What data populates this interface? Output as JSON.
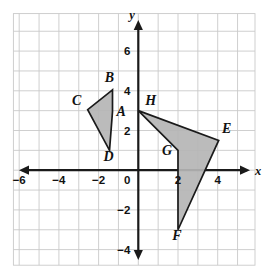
{
  "figure": {
    "kind": "coordinate-plane-diagram",
    "background_color": "#ffffff",
    "grid_color": "#c9c9c9",
    "axis_color": "#1a1a1a",
    "shape_fill_color": "#b5b5b5",
    "shape_stroke_color": "#1a1a1a"
  },
  "axes": {
    "x_label": "x",
    "y_label": "y",
    "x_ticks": [
      {
        "value": -6,
        "label": "−6"
      },
      {
        "value": -4,
        "label": "−4"
      },
      {
        "value": -2,
        "label": "−2"
      },
      {
        "value": 2,
        "label": "2"
      },
      {
        "value": 4,
        "label": "4"
      }
    ],
    "y_ticks": [
      {
        "value": 6,
        "label": "6"
      },
      {
        "value": 4,
        "label": "4"
      },
      {
        "value": 2,
        "label": "2"
      },
      {
        "value": -2,
        "label": "−2"
      },
      {
        "value": -4,
        "label": "−4"
      }
    ],
    "origin_label": "0",
    "x_range": [
      -7,
      6
    ],
    "y_range": [
      -5,
      8
    ],
    "grid_step": 1
  },
  "shapes": [
    {
      "name": "left-dart-ABCD",
      "vertices": [
        {
          "label": "B",
          "x": -1.3,
          "y": 4.05
        },
        {
          "label": "C",
          "x": -2.55,
          "y": 3.05
        },
        {
          "label": "D",
          "x": -1.45,
          "y": 1.0
        },
        {
          "label": "A",
          "x": -1.3,
          "y": 2.95
        }
      ],
      "labels": [
        {
          "label": "A",
          "x": -1.1,
          "y": 2.75,
          "anchor": "start"
        },
        {
          "label": "B",
          "x": -1.45,
          "y": 4.45,
          "anchor": "middle"
        },
        {
          "label": "C",
          "x": -3.1,
          "y": 3.3,
          "anchor": "middle"
        },
        {
          "label": "D",
          "x": -1.5,
          "y": 0.45,
          "anchor": "middle"
        }
      ]
    },
    {
      "name": "right-dart-EFGH",
      "vertices": [
        {
          "label": "H",
          "x": 0.0,
          "y": 3.0
        },
        {
          "label": "E",
          "x": 4.05,
          "y": 1.5
        },
        {
          "label": "F",
          "x": 2.0,
          "y": -3.0
        },
        {
          "label": "G",
          "x": 2.0,
          "y": 1.0
        }
      ],
      "labels": [
        {
          "label": "E",
          "x": 4.45,
          "y": 1.85,
          "anchor": "middle"
        },
        {
          "label": "F",
          "x": 1.95,
          "y": -3.5,
          "anchor": "middle"
        },
        {
          "label": "G",
          "x": 1.7,
          "y": 0.75,
          "anchor": "end"
        },
        {
          "label": "H",
          "x": 0.35,
          "y": 3.3,
          "anchor": "start"
        }
      ]
    }
  ]
}
